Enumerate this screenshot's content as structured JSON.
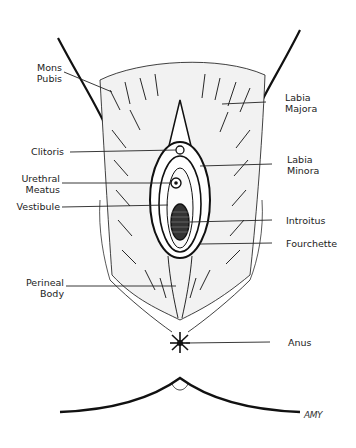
{
  "diagram": {
    "colors": {
      "ink": "#111111",
      "background": "#ffffff",
      "label": "#222222"
    },
    "labels_left": [
      {
        "id": "mons-pubis",
        "lines": [
          "Mons",
          "Pubis"
        ]
      },
      {
        "id": "clitoris",
        "lines": [
          "Clitoris"
        ]
      },
      {
        "id": "urethral-meatus",
        "lines": [
          "Urethral",
          "Meatus"
        ]
      },
      {
        "id": "vestibule",
        "lines": [
          "Vestibule"
        ]
      },
      {
        "id": "perineal-body",
        "lines": [
          "Perineal",
          "Body"
        ]
      }
    ],
    "labels_right": [
      {
        "id": "labia-majora",
        "lines": [
          "Labia",
          "Majora"
        ]
      },
      {
        "id": "labia-minora",
        "lines": [
          "Labia",
          "Minora"
        ]
      },
      {
        "id": "introitus",
        "lines": [
          "Introitus"
        ]
      },
      {
        "id": "fourchette",
        "lines": [
          "Fourchette"
        ]
      },
      {
        "id": "anus",
        "lines": [
          "Anus"
        ]
      }
    ],
    "signature": "AMY"
  }
}
